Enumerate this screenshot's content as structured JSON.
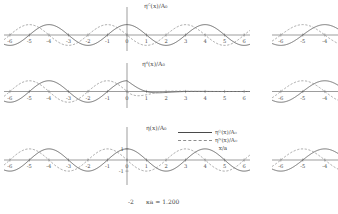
{
  "figure": {
    "background": "#ffffff",
    "ink_color": "#4a4a4a",
    "dash_color": "#8d8d8d",
    "status_text": "κa = 1.200",
    "status_tick": "-2"
  },
  "legend": {
    "position": "middle-right",
    "entries": [
      {
        "label": "ηᴳ(x)/A₀",
        "style": "solid",
        "color": "#4a4a4a"
      },
      {
        "label": "ηᴺ(x)/A₀",
        "style": "dashed",
        "color": "#8d8d8d"
      }
    ],
    "axis_label": "x/a"
  },
  "chart_data": {
    "type": "line",
    "title": "",
    "xlabel": "x/a",
    "ylabel": "",
    "xlim": [
      -6.3,
      6.3
    ],
    "ylim": [
      -1.35,
      1.35
    ],
    "grid": false,
    "xticks": [
      -6,
      -5,
      -4,
      -3,
      -2,
      -1,
      0,
      1,
      2,
      3,
      4,
      5,
      6
    ],
    "xticklabels": [
      "-6",
      "-5",
      "-4",
      "-3",
      "-2",
      "-1",
      "0",
      "1",
      "2",
      "3",
      "4",
      "5",
      "6"
    ],
    "panels": [
      {
        "id": "panel-top",
        "label": "ηᴳ(x)/A₀",
        "yticklabels": [],
        "series": [
          {
            "name": "ηᴳ(x)/A₀",
            "style": "solid",
            "color": "#4a4a4a",
            "form": "cos",
            "amplitude": 1.0,
            "wavelength": 4.0,
            "phase": 0.0,
            "damping": 0.0
          },
          {
            "name": "ηᴺ(x)/A₀",
            "style": "dashed",
            "color": "#8d8d8d",
            "form": "cos",
            "amplitude": 1.0,
            "wavelength": 4.0,
            "phase": 1.5708,
            "damping": 0.0
          }
        ]
      },
      {
        "id": "panel-middle",
        "label": "ηᵈ(x)/A₀",
        "yticklabels": [],
        "series": [
          {
            "name": "ηᴳ(x)/A₀",
            "style": "solid",
            "color": "#4a4a4a",
            "form": "cos",
            "amplitude": 1.0,
            "wavelength": 4.0,
            "phase": 0.0,
            "damping": 1.2
          },
          {
            "name": "ηᴺ(x)/A₀",
            "style": "dashed",
            "color": "#8d8d8d",
            "form": "cos",
            "amplitude": 1.0,
            "wavelength": 4.0,
            "phase": 1.5708,
            "damping": 1.2
          }
        ]
      },
      {
        "id": "panel-bottom",
        "label": "η(x)/A₀",
        "yticklabels": [
          "1",
          "-1"
        ],
        "yticks": [
          1,
          -1
        ],
        "series": [
          {
            "name": "ηᴳ(x)/A₀",
            "style": "solid",
            "color": "#4a4a4a",
            "form": "cos",
            "amplitude": 1.0,
            "wavelength": 4.0,
            "phase": 0.0,
            "damping": 0.0
          },
          {
            "name": "ηᴺ(x)/A₀",
            "style": "dashed",
            "color": "#8d8d8d",
            "form": "cos",
            "amplitude": 1.0,
            "wavelength": 4.0,
            "phase": 1.5708,
            "damping": 0.0
          }
        ]
      }
    ],
    "side_panels": [
      {
        "id": "side-top",
        "xlim": [
          -6.4,
          -3.4
        ],
        "xticklabels": [
          "-6",
          "-5",
          "-4"
        ]
      },
      {
        "id": "side-middle",
        "xlim": [
          -6.4,
          -3.4
        ],
        "xticklabels": [
          "-6",
          "-5",
          "-4"
        ]
      },
      {
        "id": "side-bottom",
        "xlim": [
          -6.4,
          -3.4
        ],
        "xticklabels": [
          "-6",
          "-5",
          "-4"
        ]
      }
    ]
  }
}
